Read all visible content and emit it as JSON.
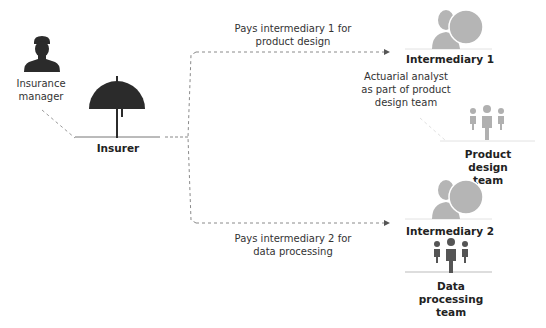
{
  "nodes": {
    "insurance_manager": {
      "label_line1": "Insurance",
      "label_line2": "manager",
      "icon": "person-icon",
      "color": "#2b2b2b"
    },
    "insurer": {
      "label": "Insurer",
      "icon": "umbrella-icon",
      "color": "#2b2b2b"
    },
    "intermediary1": {
      "label": "Intermediary 1",
      "icon": "person-with-circle-icon",
      "color": "#b5b5b5"
    },
    "actuarial": {
      "line1": "Actuarial analyst",
      "line2": "as part of product",
      "line3": "design team"
    },
    "product_design_team": {
      "line1": "Product",
      "line2": "design",
      "line3": "team",
      "icon": "group-icon",
      "color": "#b0b0b0"
    },
    "intermediary2": {
      "label": "Intermediary 2",
      "icon": "person-with-circle-icon",
      "color": "#b5b5b5"
    },
    "data_processing_team": {
      "line1": "Data",
      "line2": "processing",
      "line3": "team",
      "icon": "group-icon",
      "color": "#555555"
    }
  },
  "edges": {
    "to_intermediary1": {
      "line1": "Pays intermediary 1 for",
      "line2": "product design"
    },
    "to_intermediary2": {
      "line1": "Pays intermediary 2 for",
      "line2": "data processing"
    }
  }
}
